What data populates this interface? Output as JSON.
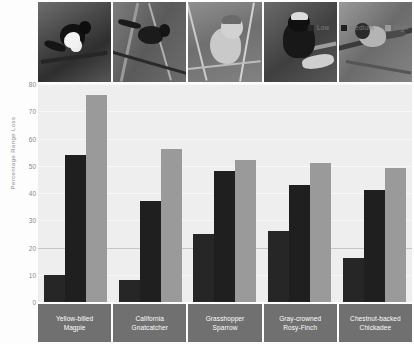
{
  "chart_data": {
    "type": "bar",
    "title": "",
    "subtitle": "",
    "xlabel": "",
    "ylabel": "Percentage Range Loss",
    "ylim": [
      0,
      80
    ],
    "yticks": [
      0,
      10,
      20,
      30,
      40,
      50,
      60,
      70,
      80
    ],
    "ytick_labels": [
      "0",
      "10",
      "20",
      "30",
      "40",
      "50",
      "60",
      "70",
      "80"
    ],
    "grid": true,
    "legend_position": "top-right",
    "categories": [
      "Yellow-billed Magpie",
      "California Gnatcatcher",
      "Grasshopper Sparrow",
      "Gray-crowned Rosy-Finch",
      "Chestnut-backed Chickadee"
    ],
    "category_lines": [
      [
        "Yellow-billed",
        "Magpie"
      ],
      [
        "California",
        "Gnatcatcher"
      ],
      [
        "Grasshopper",
        "Sparrow"
      ],
      [
        "Gray-crowned",
        "Rosy-Finch"
      ],
      [
        "Chestnut-backed",
        "Chickadee"
      ]
    ],
    "series": [
      {
        "name": "Low",
        "color": "#262626",
        "values": [
          10,
          8,
          25,
          26,
          16
        ]
      },
      {
        "name": "Medium",
        "color": "#1f1f1f",
        "values": [
          54,
          37,
          48,
          43,
          41
        ]
      },
      {
        "name": "High",
        "color": "#9a9a9a",
        "values": [
          76,
          56,
          52,
          51,
          49
        ]
      }
    ]
  },
  "legend": {
    "items": [
      {
        "label": "Low",
        "color": "#262626",
        "icon": "legend-swatch-icon"
      },
      {
        "label": "Medium",
        "color": "#1f1f1f",
        "icon": "legend-swatch-icon"
      },
      {
        "label": "High",
        "color": "#9a9a9a",
        "icon": "legend-swatch-icon"
      }
    ]
  },
  "photos": [
    {
      "alt": "Yellow-billed Magpie photograph",
      "name": "bird-photo-magpie"
    },
    {
      "alt": "California Gnatcatcher photograph",
      "name": "bird-photo-gnatcatcher"
    },
    {
      "alt": "Grasshopper Sparrow photograph",
      "name": "bird-photo-sparrow"
    },
    {
      "alt": "Gray-crowned Rosy-Finch photograph",
      "name": "bird-photo-rosy-finch"
    },
    {
      "alt": "Chestnut-backed Chickadee photograph",
      "name": "bird-photo-chickadee"
    }
  ],
  "colors": {
    "plot_background": "#eeeeee",
    "page_background": "#fdfdfd",
    "label_band": "#707070",
    "tick_text": "#8a8a8a",
    "axis_title_text": "#8d8d8d"
  }
}
